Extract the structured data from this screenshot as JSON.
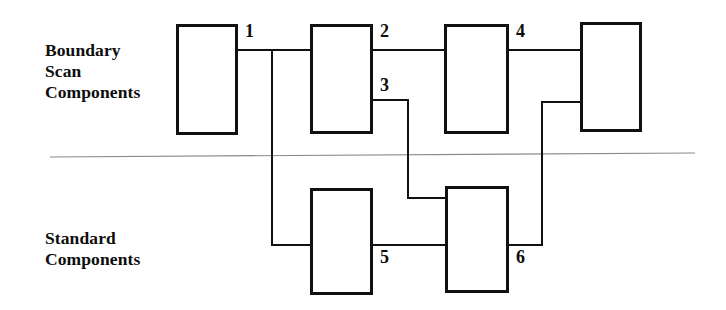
{
  "figure": {
    "width": 726,
    "height": 310,
    "background": "#ffffff",
    "line_color": "#111111",
    "divider_color": "#8a8a8a"
  },
  "groups": [
    {
      "id": "boundary-scan",
      "lines": [
        "Boundary",
        "Scan",
        "Components"
      ],
      "text": "Boundary\nScan\nComponents",
      "x": 45,
      "y": 40
    },
    {
      "id": "standard",
      "lines": [
        "Standard",
        "Components"
      ],
      "text": "Standard\nComponents",
      "x": 45,
      "y": 228
    }
  ],
  "boxes": [
    {
      "id": "bs-box-1",
      "group": "boundary-scan",
      "x": 176,
      "y": 24,
      "width": 62,
      "height": 111
    },
    {
      "id": "bs-box-2",
      "group": "boundary-scan",
      "x": 310,
      "y": 24,
      "width": 63,
      "height": 110
    },
    {
      "id": "bs-box-3",
      "group": "boundary-scan",
      "x": 444,
      "y": 24,
      "width": 65,
      "height": 110
    },
    {
      "id": "bs-box-4",
      "group": "boundary-scan",
      "x": 580,
      "y": 22,
      "width": 62,
      "height": 110
    },
    {
      "id": "std-box-5",
      "group": "standard",
      "x": 310,
      "y": 188,
      "width": 63,
      "height": 107
    },
    {
      "id": "std-box-6",
      "group": "standard",
      "x": 445,
      "y": 186,
      "width": 64,
      "height": 107
    }
  ],
  "divider": {
    "x1": 50,
    "y1": 157,
    "x2": 695,
    "y2": 153
  },
  "nets": [
    {
      "label": "1",
      "label_x": 245,
      "label_y": 22,
      "path": "M238,50 L310,50 M272,50 L272,245 L310,245"
    },
    {
      "label": "2",
      "label_x": 380,
      "label_y": 22,
      "path": "M373,50 L444,50"
    },
    {
      "label": "3",
      "label_x": 380,
      "label_y": 76,
      "path": "M373,100 L408,100 L408,198 L445,198"
    },
    {
      "label": "4",
      "label_x": 516,
      "label_y": 22,
      "path": "M509,50 L580,50"
    },
    {
      "label": "5",
      "label_x": 380,
      "label_y": 248,
      "path": "M373,245 L445,245"
    },
    {
      "label": "6",
      "label_x": 516,
      "label_y": 248,
      "path": "M509,245 L542,245 L542,102 L580,102"
    }
  ]
}
